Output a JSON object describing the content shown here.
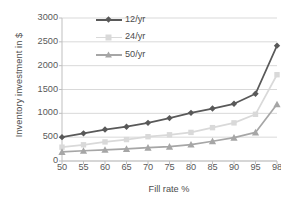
{
  "chart_data": {
    "type": "line",
    "title": "",
    "xlabel": "Fill rate %",
    "ylabel": "Inventory investment in $",
    "categories": [
      "50",
      "55",
      "60",
      "65",
      "70",
      "75",
      "80",
      "85",
      "90",
      "95",
      "98"
    ],
    "x": [
      50,
      55,
      60,
      65,
      70,
      75,
      80,
      85,
      90,
      95,
      98
    ],
    "series": [
      {
        "name": "12/yr",
        "color": "#595959",
        "marker": "diamond",
        "values": [
          500,
          580,
          660,
          720,
          800,
          900,
          1010,
          1100,
          1200,
          1410,
          2420
        ]
      },
      {
        "name": "24/yr",
        "color": "#d9d9d9",
        "marker": "square",
        "values": [
          290,
          340,
          400,
          450,
          510,
          550,
          600,
          700,
          800,
          980,
          1810
        ]
      },
      {
        "name": "50/yr",
        "color": "#a6a6a6",
        "marker": "triangle",
        "values": [
          190,
          215,
          235,
          255,
          280,
          300,
          345,
          415,
          490,
          600,
          1190
        ]
      }
    ],
    "ylim": [
      0,
      3000
    ],
    "yticks": [
      0,
      500,
      1000,
      1500,
      2000,
      2500,
      3000
    ],
    "ytick_labels": [
      "0",
      "500",
      "1000",
      "1500",
      "2000",
      "2500",
      "3000"
    ],
    "grid": "horizontal",
    "legend_position": "top-center",
    "background": "#ffffff",
    "gridline_color": "#d9d9d9",
    "axis_color": "#bfbfbf",
    "text_color": "#595959"
  }
}
